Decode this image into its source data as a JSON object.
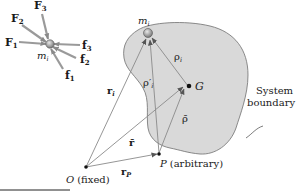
{
  "colors": {
    "body_fill": "#d9d9d9",
    "body_stroke": "#6e6e6e",
    "vector": "#8a8a8a",
    "particle": "#9a9a9a",
    "text": "#1a1a1a"
  },
  "inset": {
    "particle_label": "m",
    "particle_sub": "i",
    "external_forces": [
      {
        "label": "F",
        "sub": "1"
      },
      {
        "label": "F",
        "sub": "2"
      },
      {
        "label": "F",
        "sub": "3"
      }
    ],
    "internal_forces": [
      {
        "label": "f",
        "sub": "1"
      },
      {
        "label": "f",
        "sub": "2"
      },
      {
        "label": "f",
        "sub": "3"
      }
    ]
  },
  "main": {
    "particle_label": "m",
    "particle_sub": "i",
    "center_of_mass": "G",
    "origin": {
      "label": "O",
      "note": "(fixed)"
    },
    "point_p": {
      "label": "P",
      "note": "(arbitrary)"
    },
    "boundary_label_line1": "System",
    "boundary_label_line2": "boundary",
    "vectors": {
      "r_i": {
        "label": "r",
        "sub": "i"
      },
      "rho_i": {
        "label": "ρ",
        "sub": "i"
      },
      "rho_prime_i": {
        "label": "ρ′",
        "sub": "i"
      },
      "r_bar": {
        "label": "r̄"
      },
      "rho_bar": {
        "label": "ρ̄"
      },
      "r_p": {
        "label": "r",
        "sub": "P"
      }
    }
  }
}
